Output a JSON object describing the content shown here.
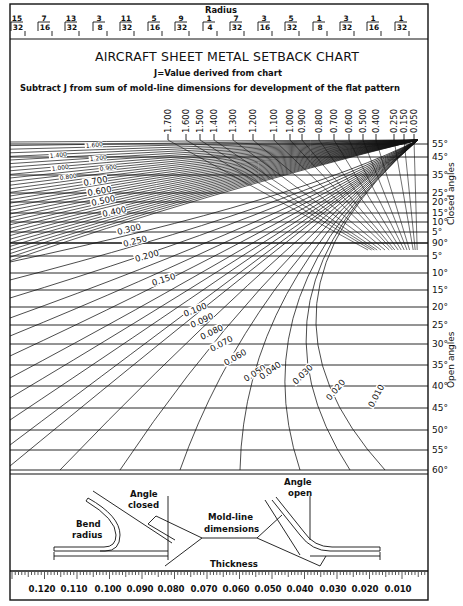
{
  "chart_data": {
    "type": "line",
    "title": "AIRCRAFT SHEET METAL SETBACK CHART",
    "subtitle_1": "J=Value derived from chart",
    "subtitle_2": "Subtract J from sum of mold-line dimensions for development of the flat pattern",
    "radius_axis": {
      "label": "Radius",
      "ticks": [
        {
          "num": "15",
          "den": "32",
          "x": 17
        },
        {
          "num": "7",
          "den": "16",
          "x": 44
        },
        {
          "num": "13",
          "den": "32",
          "x": 71
        },
        {
          "num": "3",
          "den": "8",
          "x": 99
        },
        {
          "num": "11",
          "den": "32",
          "x": 126
        },
        {
          "num": "5",
          "den": "16",
          "x": 154
        },
        {
          "num": "9",
          "den": "32",
          "x": 181
        },
        {
          "num": "1",
          "den": "4",
          "x": 209
        },
        {
          "num": "7",
          "den": "32",
          "x": 236
        },
        {
          "num": "3",
          "den": "16",
          "x": 264
        },
        {
          "num": "5",
          "den": "32",
          "x": 291
        },
        {
          "num": "1",
          "den": "8",
          "x": 319
        },
        {
          "num": "3",
          "den": "32",
          "x": 346
        },
        {
          "num": "1",
          "den": "16",
          "x": 373
        },
        {
          "num": "1",
          "den": "32",
          "x": 401
        }
      ]
    },
    "j_value_axis_top": {
      "ticks": [
        {
          "label": "1.700",
          "x": 168
        },
        {
          "label": "1.600",
          "x": 186
        },
        {
          "label": "1.500",
          "x": 200
        },
        {
          "label": "1.400",
          "x": 214
        },
        {
          "label": "1.300",
          "x": 233
        },
        {
          "label": "1.200",
          "x": 253
        },
        {
          "label": "1.100",
          "x": 274
        },
        {
          "label": "1.000",
          "x": 290
        },
        {
          "label": "0.900",
          "x": 302
        },
        {
          "label": "0.800",
          "x": 319
        },
        {
          "label": "0.700",
          "x": 334
        },
        {
          "label": "0.600",
          "x": 349
        },
        {
          "label": "0.500",
          "x": 363
        },
        {
          "label": "0.400",
          "x": 376
        },
        {
          "label": "0.250",
          "x": 394
        },
        {
          "label": "0.150",
          "x": 404
        },
        {
          "label": "0.050",
          "x": 414
        }
      ]
    },
    "angle_axis": {
      "closed_label": "Closed angles",
      "open_label": "Open angles",
      "closed": [
        {
          "label": "55°",
          "y": 144
        },
        {
          "label": "45°",
          "y": 157
        },
        {
          "label": "35°",
          "y": 175
        },
        {
          "label": "25°",
          "y": 193
        },
        {
          "label": "20°",
          "y": 202
        },
        {
          "label": "15°",
          "y": 213
        },
        {
          "label": "10°",
          "y": 222
        },
        {
          "label": "5°",
          "y": 232
        }
      ],
      "ninety": {
        "label": "90°",
        "y": 243
      },
      "open": [
        {
          "label": "5°",
          "y": 256
        },
        {
          "label": "10°",
          "y": 273
        },
        {
          "label": "15°",
          "y": 290
        },
        {
          "label": "20°",
          "y": 307
        },
        {
          "label": "25°",
          "y": 325
        },
        {
          "label": "30°",
          "y": 344
        },
        {
          "label": "35°",
          "y": 365
        },
        {
          "label": "40°",
          "y": 386
        },
        {
          "label": "45°",
          "y": 408
        },
        {
          "label": "50°",
          "y": 430
        },
        {
          "label": "55°",
          "y": 450
        },
        {
          "label": "60°",
          "y": 470
        }
      ]
    },
    "curve_labels": [
      {
        "label": "1.600",
        "x": 86,
        "y": 148,
        "rot": -6,
        "size": 6
      },
      {
        "label": "1.400",
        "x": 50,
        "y": 158,
        "rot": -6,
        "size": 6
      },
      {
        "label": "1.200",
        "x": 90,
        "y": 161,
        "rot": -6,
        "size": 6
      },
      {
        "label": "1.000",
        "x": 52,
        "y": 171,
        "rot": -8,
        "size": 6
      },
      {
        "label": "0.900",
        "x": 100,
        "y": 171,
        "rot": -8,
        "size": 6
      },
      {
        "label": "0.800",
        "x": 60,
        "y": 180,
        "rot": -8,
        "size": 6
      },
      {
        "label": "0.700",
        "x": 84,
        "y": 186,
        "rot": -10,
        "size": 8.5
      },
      {
        "label": "0.600",
        "x": 88,
        "y": 196,
        "rot": -10,
        "size": 8.5
      },
      {
        "label": "0.500",
        "x": 92,
        "y": 206,
        "rot": -12,
        "size": 8.5
      },
      {
        "label": "0.400",
        "x": 103,
        "y": 217,
        "rot": -12,
        "size": 8.5
      },
      {
        "label": "0.300",
        "x": 118,
        "y": 235,
        "rot": -14,
        "size": 8.5
      },
      {
        "label": "0.250",
        "x": 124,
        "y": 247,
        "rot": -14,
        "size": 8.5
      },
      {
        "label": "0.200",
        "x": 136,
        "y": 262,
        "rot": -16,
        "size": 8.5
      },
      {
        "label": "0.150",
        "x": 153,
        "y": 286,
        "rot": -18,
        "size": 8.5
      },
      {
        "label": "0.100",
        "x": 185,
        "y": 317,
        "rot": -22,
        "size": 8.5
      },
      {
        "label": "0.090",
        "x": 192,
        "y": 328,
        "rot": -24,
        "size": 8.5
      },
      {
        "label": "0.080",
        "x": 202,
        "y": 340,
        "rot": -26,
        "size": 8.5
      },
      {
        "label": "0.070",
        "x": 212,
        "y": 352,
        "rot": -28,
        "size": 8.5
      },
      {
        "label": "0.060",
        "x": 226,
        "y": 366,
        "rot": -30,
        "size": 8.5
      },
      {
        "label": "0.050",
        "x": 246,
        "y": 382,
        "rot": -32,
        "size": 8.5
      },
      {
        "label": "0.040",
        "x": 262,
        "y": 380,
        "rot": -36,
        "size": 8.5
      },
      {
        "label": "0.030",
        "x": 296,
        "y": 385,
        "rot": -44,
        "size": 8.5
      },
      {
        "label": "0.020",
        "x": 330,
        "y": 401,
        "rot": -50,
        "size": 8.5
      },
      {
        "label": "0.010",
        "x": 373,
        "y": 408,
        "rot": -62,
        "size": 8.5
      }
    ],
    "thickness_axis": {
      "label": "Thickness",
      "ticks": [
        {
          "label": "0.120",
          "x": 36
        },
        {
          "label": "0.110",
          "x": 68
        },
        {
          "label": "0.100",
          "x": 102
        },
        {
          "label": "0.090",
          "x": 134
        },
        {
          "label": "0.080",
          "x": 165
        },
        {
          "label": "0.070",
          "x": 198
        },
        {
          "label": "0.060",
          "x": 230
        },
        {
          "label": "0.050",
          "x": 262
        },
        {
          "label": "0.040",
          "x": 294
        },
        {
          "label": "0.030",
          "x": 327
        },
        {
          "label": "0.020",
          "x": 359
        },
        {
          "label": "0.010",
          "x": 392
        }
      ]
    },
    "diagram_labels": {
      "bend_radius_1": "Bend",
      "bend_radius_2": "radius",
      "angle_closed_1": "Angle",
      "angle_closed_2": "closed",
      "mold_line_1": "Mold-line",
      "mold_line_2": "dimensions",
      "angle_open_1": "Angle",
      "angle_open_2": "open",
      "thickness": "Thickness"
    },
    "xlabel": "Thickness",
    "ylabel": "Closed angles / Open angles",
    "grid": true
  }
}
